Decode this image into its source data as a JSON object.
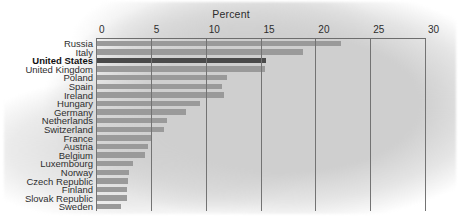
{
  "chart_data": {
    "type": "bar",
    "orientation": "horizontal",
    "title": "Percent",
    "xlabel": "Percent",
    "ylabel": "",
    "xlim": [
      0,
      30
    ],
    "xticks": [
      0,
      5,
      10,
      15,
      20,
      25,
      30
    ],
    "xtick_labels": [
      "0",
      "5",
      "10",
      "15",
      "20",
      "25",
      "30"
    ],
    "grid": true,
    "legend": false,
    "highlight_category": "United States",
    "colors": {
      "bar": "#9a9a9a",
      "bar_highlight": "#4a4a4a",
      "gridline": "#737373",
      "axis": "#6d6d6d",
      "background_blob": "#cfcfcf",
      "page_background": "#ffffff",
      "text": "#2e2e2e"
    },
    "categories": [
      "Russia",
      "Italy",
      "United States",
      "United Kingdom",
      "Poland",
      "Spain",
      "Ireland",
      "Hungary",
      "Germany",
      "Netherlands",
      "Switzerland",
      "France",
      "Austria",
      "Belgium",
      "Luxembourg",
      "Norway",
      "Czech Republic",
      "Finland",
      "Slovak Republic",
      "Sweden"
    ],
    "values": [
      22.3,
      18.9,
      15.5,
      15.4,
      11.9,
      11.5,
      11.7,
      9.5,
      8.2,
      6.5,
      6.2,
      5.1,
      4.7,
      4.5,
      3.4,
      3.0,
      2.9,
      2.8,
      2.8,
      2.3
    ]
  }
}
